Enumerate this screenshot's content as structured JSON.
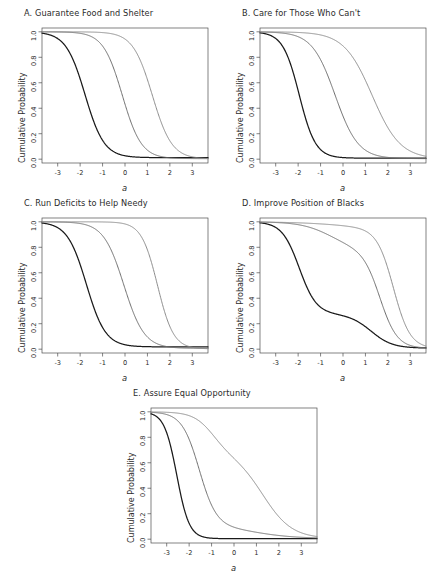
{
  "figure": {
    "background": "#ffffff",
    "axis_color": "#4d4d4d",
    "text_color": "#2b2b2b"
  },
  "chart_data": {
    "type": "line",
    "title": "",
    "xlabel": "a",
    "ylabel": "Cumulative Probability",
    "xlim": [
      -3.7,
      3.7
    ],
    "ylim": [
      -0.03,
      1.03
    ],
    "xticks": [
      "-3",
      "-2",
      "-1",
      "0",
      "1",
      "2",
      "3"
    ],
    "xtick_values": [
      -3,
      -2,
      -1,
      0,
      1,
      2,
      3
    ],
    "yticks": [
      "0.0",
      "0.2",
      "0.4",
      "0.6",
      "0.8",
      "1.0"
    ],
    "ytick_values": [
      0.0,
      0.2,
      0.4,
      0.6,
      0.8,
      1.0
    ],
    "grid": false,
    "legend": "none",
    "series_colors": [
      "#1a1a1a",
      "#6e6e6e",
      "#8c8c8c"
    ],
    "panels": [
      {
        "key": "A",
        "title": "A. Guarantee Food and Shelter",
        "series": [
          {
            "name": "curve-1",
            "color": "#1a1a1a",
            "shape": "logistic",
            "params": {
              "center": -1.78,
              "slope": 2.35,
              "floor": 0.012
            }
          },
          {
            "name": "curve-2",
            "color": "#6e6e6e",
            "shape": "logistic",
            "params": {
              "center": -0.12,
              "slope": 2.35,
              "floor": 0.004
            }
          },
          {
            "name": "curve-3",
            "color": "#8c8c8c",
            "shape": "logistic",
            "params": {
              "center": 1.22,
              "slope": 2.3,
              "floor": 0.002
            }
          }
        ]
      },
      {
        "key": "B",
        "title": "B. Care for Those Who Can't",
        "series": [
          {
            "name": "curve-1",
            "color": "#1a1a1a",
            "shape": "logistic",
            "params": {
              "center": -1.95,
              "slope": 2.75,
              "floor": 0.008
            }
          },
          {
            "name": "curve-2",
            "color": "#6e6e6e",
            "shape": "logistic",
            "params": {
              "center": -0.35,
              "slope": 1.95,
              "floor": 0.004
            }
          },
          {
            "name": "curve-3",
            "color": "#8c8c8c",
            "shape": "logistic",
            "params": {
              "center": 1.3,
              "slope": 1.6,
              "floor": 0.002
            }
          }
        ]
      },
      {
        "key": "C",
        "title": "C. Run Deficits to Help Needy",
        "series": [
          {
            "name": "curve-1",
            "color": "#1a1a1a",
            "shape": "logistic",
            "params": {
              "center": -1.72,
              "slope": 2.35,
              "floor": 0.018
            }
          },
          {
            "name": "curve-2",
            "color": "#6e6e6e",
            "shape": "logistic",
            "params": {
              "center": -0.05,
              "slope": 2.2,
              "floor": 0.006
            }
          },
          {
            "name": "curve-3",
            "color": "#8c8c8c",
            "shape": "logistic",
            "params": {
              "center": 1.45,
              "slope": 2.8,
              "floor": 0.002
            }
          }
        ]
      },
      {
        "key": "D",
        "title": "D. Improve Position of Blacks",
        "series": [
          {
            "name": "curve-1",
            "color": "#1a1a1a",
            "shape": "two-step",
            "params": {
              "c1": -1.95,
              "s1": 2.6,
              "w1": 0.73,
              "c2": 1.25,
              "s2": 2.1,
              "floor": 0.008
            }
          },
          {
            "name": "curve-2",
            "color": "#6e6e6e",
            "shape": "two-step",
            "params": {
              "c1": -0.55,
              "s1": 1.5,
              "w1": 0.22,
              "c2": 1.65,
              "s2": 2.6,
              "floor": 0.006
            }
          },
          {
            "name": "curve-3",
            "color": "#8c8c8c",
            "shape": "two-step",
            "params": {
              "c1": 0.1,
              "s1": 0.9,
              "w1": 0.06,
              "c2": 2.25,
              "s2": 2.7,
              "floor": 0.004
            }
          }
        ]
      },
      {
        "key": "E",
        "title": "E. Assure Equal Opportunity",
        "series": [
          {
            "name": "curve-1",
            "color": "#1a1a1a",
            "shape": "logistic",
            "params": {
              "center": -2.55,
              "slope": 3.6,
              "floor": 0.004
            }
          },
          {
            "name": "curve-2",
            "color": "#6e6e6e",
            "shape": "two-step",
            "params": {
              "c1": -1.55,
              "s1": 2.6,
              "w1": 0.9,
              "c2": 0.9,
              "s2": 1.1,
              "floor": 0.006
            }
          },
          {
            "name": "curve-3",
            "color": "#8c8c8c",
            "shape": "two-step",
            "params": {
              "c1": -0.95,
              "s1": 2.3,
              "w1": 0.32,
              "c2": 1.3,
              "s2": 1.55,
              "floor": 0.005
            }
          }
        ]
      }
    ]
  },
  "layout": {
    "panel_positions": [
      {
        "key": "A",
        "left": 8,
        "top": 8,
        "width": 210,
        "height": 190
      },
      {
        "key": "B",
        "left": 226,
        "top": 8,
        "width": 209,
        "height": 190
      },
      {
        "key": "C",
        "left": 8,
        "top": 198,
        "width": 210,
        "height": 190
      },
      {
        "key": "D",
        "left": 226,
        "top": 198,
        "width": 209,
        "height": 190
      },
      {
        "key": "E",
        "left": 117,
        "top": 388,
        "width": 210,
        "height": 193
      }
    ]
  }
}
